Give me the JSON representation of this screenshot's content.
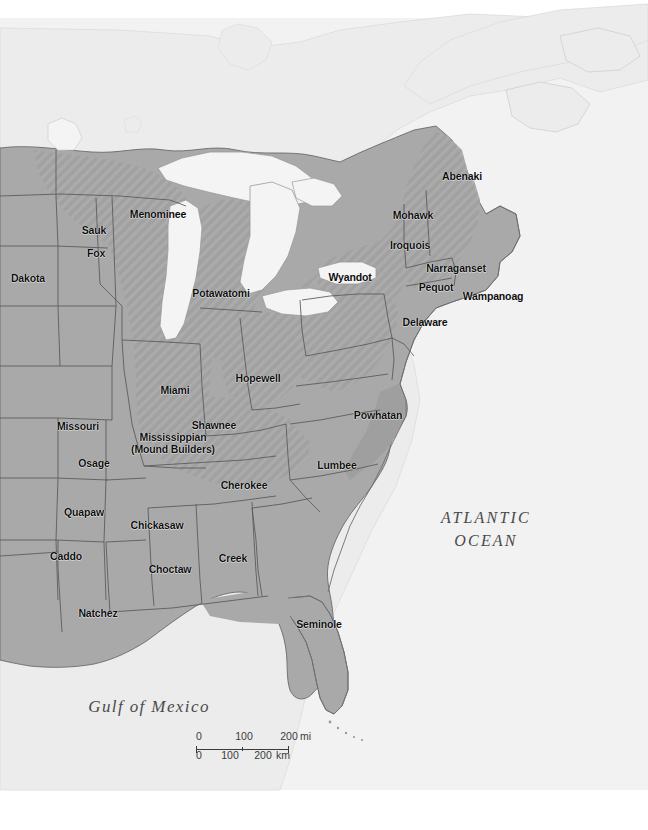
{
  "map": {
    "title": "Native Peoples of Eastern North America",
    "projection_note": "",
    "colors": {
      "ocean": "#f2f2f2",
      "background_land": "#ececec",
      "land_gray": "#a9a9a9",
      "land_gray_dark": "#9d9d9d",
      "hatch_region": "#9b9b9b",
      "lake": "#f4f4f4",
      "border": "#5a5a5a",
      "coast": "#7a7a7a",
      "label_text": "#0d0d0d",
      "water_label_text": "#4a4a4a"
    },
    "tribes": [
      {
        "name": "Abenaki",
        "x": 462,
        "y": 177
      },
      {
        "name": "Mohawk",
        "x": 413,
        "y": 216
      },
      {
        "name": "Iroquois",
        "x": 410,
        "y": 246
      },
      {
        "name": "Wyandot",
        "x": 350,
        "y": 278
      },
      {
        "name": "Narraganset",
        "x": 456,
        "y": 269
      },
      {
        "name": "Pequot",
        "x": 436,
        "y": 288
      },
      {
        "name": "Wampanoag",
        "x": 493,
        "y": 297
      },
      {
        "name": "Delaware",
        "x": 425,
        "y": 323
      },
      {
        "name": "Menominee",
        "x": 158,
        "y": 215
      },
      {
        "name": "Sauk",
        "x": 94,
        "y": 231
      },
      {
        "name": "Fox",
        "x": 96,
        "y": 254
      },
      {
        "name": "Dakota",
        "x": 28,
        "y": 279
      },
      {
        "name": "Potawatomi",
        "x": 221,
        "y": 294
      },
      {
        "name": "Hopewell",
        "x": 258,
        "y": 379
      },
      {
        "name": "Miami",
        "x": 175,
        "y": 391
      },
      {
        "name": "Shawnee",
        "x": 214,
        "y": 426
      },
      {
        "name": "Missouri",
        "x": 78,
        "y": 427
      },
      {
        "name": "Powhatan",
        "x": 378,
        "y": 416
      },
      {
        "name": "Mississippian\n(Mound Builders)",
        "x": 173,
        "y": 444,
        "two_line": true
      },
      {
        "name": "Osage",
        "x": 94,
        "y": 464
      },
      {
        "name": "Cherokee",
        "x": 244,
        "y": 486
      },
      {
        "name": "Lumbee",
        "x": 337,
        "y": 466
      },
      {
        "name": "Quapaw",
        "x": 84,
        "y": 513
      },
      {
        "name": "Chickasaw",
        "x": 157,
        "y": 526
      },
      {
        "name": "Caddo",
        "x": 66,
        "y": 557
      },
      {
        "name": "Choctaw",
        "x": 170,
        "y": 570
      },
      {
        "name": "Creek",
        "x": 233,
        "y": 559
      },
      {
        "name": "Natchez",
        "x": 98,
        "y": 614
      },
      {
        "name": "Seminole",
        "x": 319,
        "y": 625
      }
    ],
    "water_labels": [
      {
        "name": "ATLANTIC\nOCEAN",
        "x": 486,
        "y": 529,
        "style": "ocean"
      },
      {
        "name": "Gulf of Mexico",
        "x": 149,
        "y": 707,
        "style": "gulf"
      }
    ],
    "scale": {
      "miles": {
        "ticks": [
          "0",
          "100",
          "200"
        ],
        "unit": "mi"
      },
      "km": {
        "ticks": [
          "0",
          "100",
          "200"
        ],
        "unit": "km"
      }
    }
  }
}
